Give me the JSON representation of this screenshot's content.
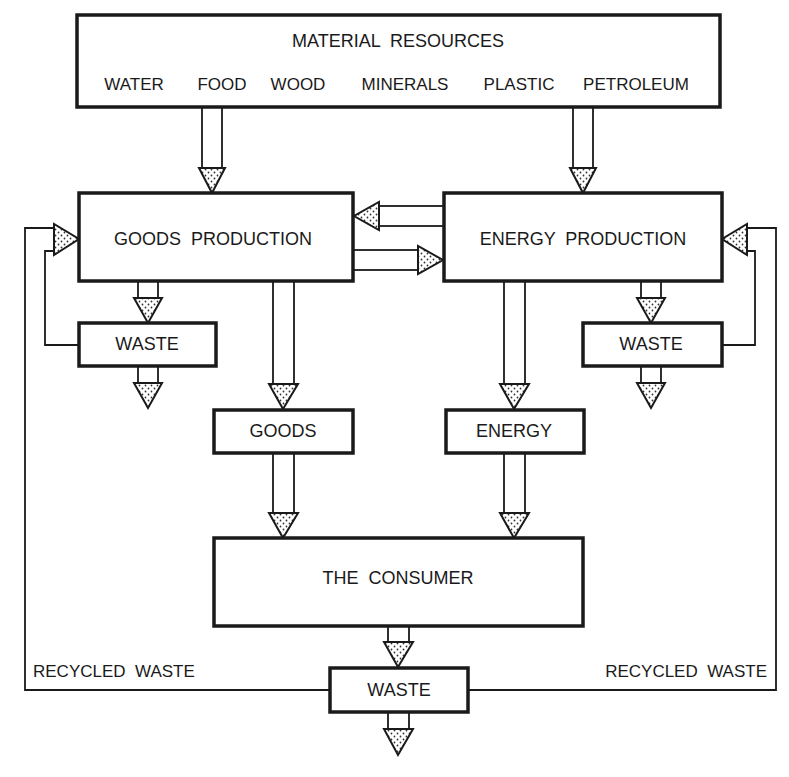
{
  "diagram": {
    "material_resources": {
      "title": "MATERIAL  RESOURCES",
      "items": [
        "WATER",
        "FOOD",
        "WOOD",
        "MINERALS",
        "PLASTIC",
        "PETROLEUM"
      ]
    },
    "goods_production": "GOODS  PRODUCTION",
    "energy_production": "ENERGY  PRODUCTION",
    "waste_left": "WASTE",
    "waste_right": "WASTE",
    "goods": "GOODS",
    "energy": "ENERGY",
    "consumer": "THE  CONSUMER",
    "waste_bottom": "WASTE",
    "recycled_left": "RECYCLED  WASTE",
    "recycled_right": "RECYCLED  WASTE",
    "colors": {
      "ink": "#1a1a1a",
      "background": "#ffffff"
    }
  }
}
